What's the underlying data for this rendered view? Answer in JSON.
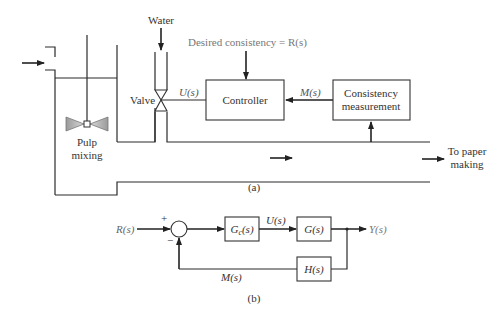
{
  "figure_a": {
    "caption": "(a)",
    "water_label": "Water",
    "desired_label": "Desired consistency = R(s)",
    "valve_label": "Valve",
    "u_label": "U(s)",
    "m_label": "M(s)",
    "controller_label": "Controller",
    "measurement_line1": "Consistency",
    "measurement_line2": "measurement",
    "mixing_line1": "Pulp",
    "mixing_line2": "mixing",
    "output_line1": "To paper",
    "output_line2": "making"
  },
  "figure_b": {
    "caption": "(b)",
    "input_label": "R(s)",
    "plus_sign": "+",
    "minus_sign": "−",
    "controller_block": "Gc(s)",
    "controller_block_main": "G",
    "controller_block_sub": "c",
    "controller_block_tail": "(s)",
    "u_label": "U(s)",
    "plant_block": "G(s)",
    "output_label": "Y(s)",
    "feedback_block": "H(s)",
    "m_label": "M(s)"
  },
  "colors": {
    "line": "#2a2a2a",
    "text": "#333333",
    "signal_text": "#555555",
    "agitator_fill": "#b8b8b8"
  }
}
